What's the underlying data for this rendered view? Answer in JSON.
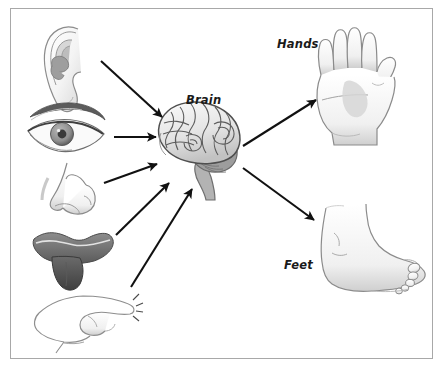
{
  "figure": {
    "frame_color": "#a8a8a8",
    "background_color": "#ffffff",
    "ink_color": "#1a1a1a"
  },
  "labels": {
    "brain": "Brain",
    "hands": "Hands",
    "feet": "Feet"
  },
  "inputs": [
    {
      "id": "ear",
      "name": "ear-illustration",
      "sense": "hearing"
    },
    {
      "id": "eye",
      "name": "eye-illustration",
      "sense": "sight"
    },
    {
      "id": "nose",
      "name": "nose-illustration",
      "sense": "smell"
    },
    {
      "id": "mouth",
      "name": "mouth-illustration",
      "sense": "taste"
    },
    {
      "id": "finger",
      "name": "finger-illustration",
      "sense": "touch"
    }
  ],
  "outputs": [
    {
      "id": "hand",
      "name": "hand-illustration",
      "label": "Hands"
    },
    {
      "id": "foot",
      "name": "foot-illustration",
      "label": "Feet"
    }
  ],
  "arrows": [
    {
      "id": "ear-to-brain",
      "from": "ear",
      "to": "brain"
    },
    {
      "id": "eye-to-brain",
      "from": "eye",
      "to": "brain"
    },
    {
      "id": "nose-to-brain",
      "from": "nose",
      "to": "brain"
    },
    {
      "id": "mouth-to-brain",
      "from": "mouth",
      "to": "brain"
    },
    {
      "id": "finger-to-brain",
      "from": "finger",
      "to": "brain"
    },
    {
      "id": "brain-to-hands",
      "from": "brain",
      "to": "hands"
    },
    {
      "id": "brain-to-feet",
      "from": "brain",
      "to": "feet"
    }
  ]
}
